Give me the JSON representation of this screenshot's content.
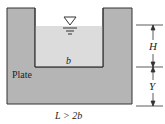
{
  "diagram": {
    "plate_label": "Plate",
    "width_label": "b",
    "bottom_label": "L > 2b",
    "dimension_top": "H",
    "dimension_bottom": "Y",
    "free_surface_symbol": "▽",
    "colors": {
      "plate": "#b5b5b5",
      "water": "#dcdcdc",
      "outline": "#333333",
      "background": "#ffffff"
    }
  }
}
